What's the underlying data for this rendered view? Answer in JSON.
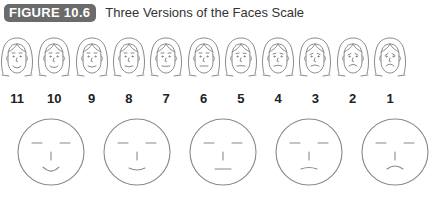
{
  "header": {
    "badge": "FIGURE 10.6",
    "title": "Three Versions of the Faces Scale"
  },
  "colors": {
    "badge_bg": "#6b6b6b",
    "line": "#8a8a8a",
    "text": "#222222"
  },
  "illustrated_faces": [
    {
      "label": "11",
      "mood": 1.0
    },
    {
      "label": "10",
      "mood": 0.8
    },
    {
      "label": "9",
      "mood": 0.6
    },
    {
      "label": "8",
      "mood": 0.4
    },
    {
      "label": "7",
      "mood": 0.2
    },
    {
      "label": "6",
      "mood": 0.0
    },
    {
      "label": "5",
      "mood": -0.2
    },
    {
      "label": "4",
      "mood": -0.4
    },
    {
      "label": "3",
      "mood": -0.6
    },
    {
      "label": "2",
      "mood": -0.8
    },
    {
      "label": "1",
      "mood": -1.0
    }
  ],
  "simple_faces": [
    {
      "mood": 1.0
    },
    {
      "mood": 0.5
    },
    {
      "mood": 0.0
    },
    {
      "mood": -0.5
    },
    {
      "mood": -1.0
    }
  ],
  "footer": {
    "text": "Row 3 partially visible (cropped)"
  }
}
